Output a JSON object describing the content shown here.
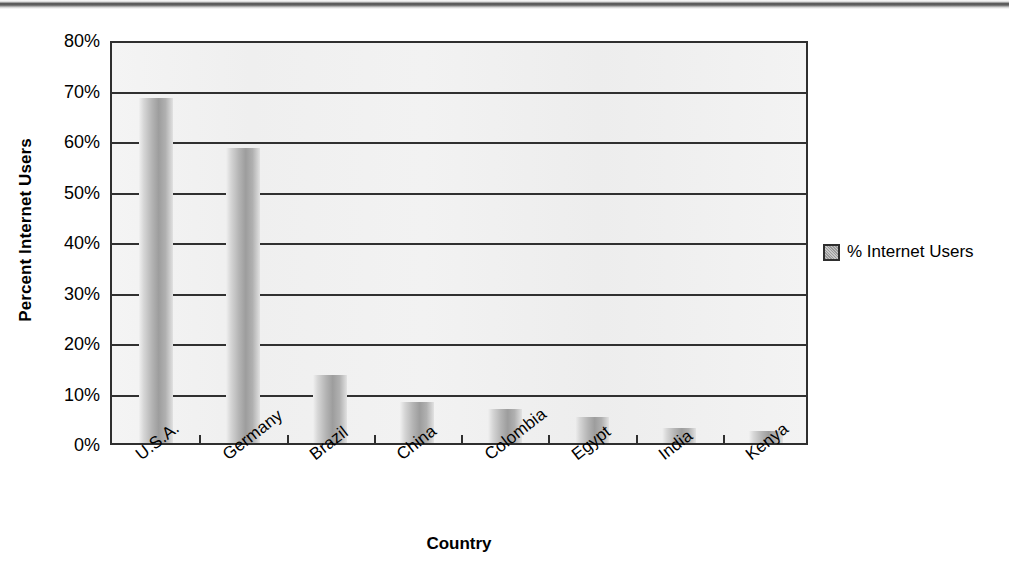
{
  "chart_data": {
    "type": "bar",
    "title": "",
    "xlabel": "Country",
    "ylabel": "Percent Internet Users",
    "categories": [
      "U.S.A.",
      "Germany",
      "Brazil",
      "China",
      "Colombia",
      "Egypt",
      "India",
      "Kenya"
    ],
    "series": [
      {
        "name": "% Internet Users",
        "values": [
          68.8,
          58.9,
          13.8,
          8.5,
          7.2,
          5.5,
          3.4,
          2.8
        ]
      }
    ],
    "ylim": [
      0,
      80
    ],
    "ytick_values": [
      0,
      10,
      20,
      30,
      40,
      50,
      60,
      70,
      80
    ],
    "ytick_labels": [
      "0%",
      "10%",
      "20%",
      "30%",
      "40%",
      "50%",
      "60%",
      "70%",
      "80%"
    ],
    "grid": true,
    "legend_position": "right",
    "legend_entries": [
      "% Internet Users"
    ],
    "bar_fill": "#9d9d9d",
    "axis_color": "#2f2f2f",
    "plot_background": "#f1f1f1"
  },
  "legend": {
    "label": "% Internet Users"
  },
  "axes": {
    "y_title": "Percent Internet Users",
    "x_title": "Country"
  },
  "artifacts": {
    "bottom_caption_fragment": ""
  }
}
